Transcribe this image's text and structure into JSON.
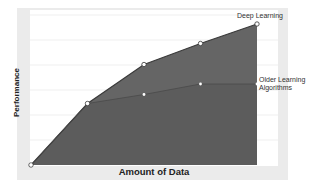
{
  "chart_data": {
    "type": "area",
    "title": "",
    "xlabel": "Amount of Data",
    "ylabel": "Performance",
    "x": [
      0,
      1,
      2,
      3,
      4
    ],
    "series": [
      {
        "name": "Deep Learning",
        "values": [
          0,
          41,
          67,
          81,
          94
        ],
        "color": "#5a5a5a"
      },
      {
        "name": "Older Learning Algorithms",
        "values": [
          0,
          41,
          47,
          54,
          54
        ],
        "color": "#555555"
      }
    ],
    "ylim": [
      0,
      100
    ],
    "grid": true,
    "legend": "inline labels at line ends",
    "tick_labels": "none"
  },
  "labels": {
    "deep_learning": "Deep Learning",
    "older_line1": "Older Learning",
    "older_line2": "Algorithms",
    "xlabel": "Amount of Data",
    "ylabel": "Performance"
  },
  "colors": {
    "panel_bg": "#ebebeb",
    "plot_bg": "#ffffff",
    "area_fill": "#616161",
    "line": "#3a3a3a",
    "grid": "#eeeeee"
  }
}
